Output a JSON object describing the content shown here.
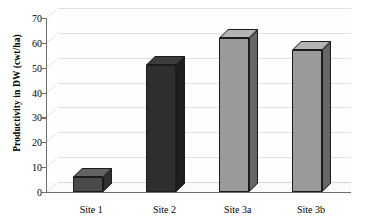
{
  "chart_data": {
    "type": "bar",
    "title": "",
    "subtitle": "",
    "xlabel": "",
    "ylabel": "Productivity in DW (cwt/ha)",
    "categories": [
      "Site 1",
      "Site 2",
      "Site 3a",
      "Site 3b"
    ],
    "values": [
      6,
      51,
      62,
      57
    ],
    "series": [
      {
        "name": "Productivity in DW (cwt/ha)",
        "values": [
          6,
          51,
          62,
          57
        ]
      }
    ],
    "ylim": [
      0,
      70
    ],
    "ytick_labels": [
      "0",
      "10",
      "20",
      "30",
      "40",
      "50",
      "60",
      "70"
    ],
    "ytick_values": [
      0,
      10,
      20,
      30,
      40,
      50,
      60,
      70
    ],
    "grid": true,
    "grid_axis": "y",
    "legend": false,
    "legend_position": "none",
    "three_d": true,
    "bar_colors": [
      "#4a4a4a",
      "#2e2e2e",
      "#9a9a9a",
      "#9a9a9a"
    ],
    "bar_top_colors": [
      "#636363",
      "#3c3c3c",
      "#b4b4b4",
      "#b4b4b4"
    ],
    "bar_side_colors": [
      "#303030",
      "#1e1e1e",
      "#666666",
      "#666666"
    ],
    "annotations": [],
    "plot_background": "#ffffff",
    "grid_color": "#e2e2e2",
    "axis_color": "#6e6e6e"
  }
}
